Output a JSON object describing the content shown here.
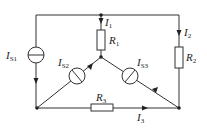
{
  "diagram": {
    "type": "circuit",
    "colors": {
      "line": "#333333",
      "background": "#ffffff"
    },
    "nodes": [
      {
        "id": "top-left-corner",
        "x": 36,
        "y": 15
      },
      {
        "id": "top-junction",
        "x": 101,
        "y": 15
      },
      {
        "id": "top-right-corner",
        "x": 179,
        "y": 15
      },
      {
        "id": "center-node",
        "x": 101,
        "y": 57
      },
      {
        "id": "bottom-left-node",
        "x": 37,
        "y": 108
      },
      {
        "id": "bottom-right-node",
        "x": 179,
        "y": 108
      }
    ],
    "components": {
      "is1": {
        "label": "I",
        "sub": "S1",
        "kind": "current-source"
      },
      "is2": {
        "label": "I",
        "sub": "S2",
        "kind": "current-source"
      },
      "is3": {
        "label": "I",
        "sub": "S3",
        "kind": "current-source"
      },
      "r1": {
        "label": "R",
        "sub": "1",
        "kind": "resistor"
      },
      "r2": {
        "label": "R",
        "sub": "2",
        "kind": "resistor"
      },
      "r3": {
        "label": "R",
        "sub": "3",
        "kind": "resistor"
      }
    },
    "currents": {
      "i1": {
        "label": "I",
        "sub": "1"
      },
      "i2": {
        "label": "I",
        "sub": "2"
      },
      "i3": {
        "label": "I",
        "sub": "3"
      }
    }
  }
}
